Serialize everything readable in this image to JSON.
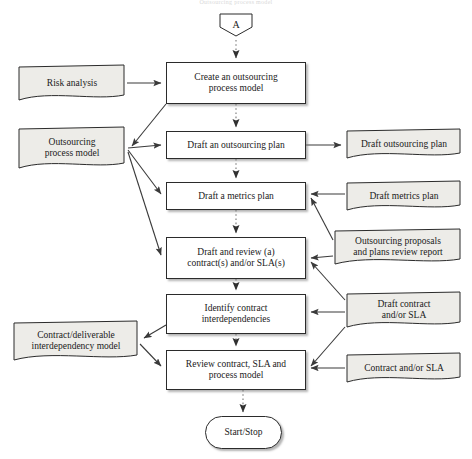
{
  "diagram": {
    "title_strip": "Outsourcing process model",
    "colors": {
      "document_fill": "#edece8",
      "process_fill": "#ffffff",
      "stroke": "#2b2b2b",
      "arrow_solid": "#3a3a3a",
      "arrow_dotted": "#8c8c8c",
      "shadow": "#9a9a9a"
    },
    "nodes": [
      {
        "id": "connector-a",
        "shape": "connector",
        "label": "A",
        "x": 218,
        "y": 12,
        "w": 36,
        "h": 26,
        "font": 10
      },
      {
        "id": "risk-analysis",
        "shape": "document",
        "label": "Risk analysis",
        "x": 17,
        "y": 64,
        "w": 110,
        "h": 38,
        "font": 9.5
      },
      {
        "id": "create-process-model",
        "shape": "process",
        "label": "Create an outsourcing\nprocess model",
        "x": 166,
        "y": 62,
        "w": 140,
        "h": 42,
        "font": 9.5
      },
      {
        "id": "outsourcing-process-model",
        "shape": "document",
        "label": "Outsourcing\nprocess model",
        "x": 17,
        "y": 126,
        "w": 110,
        "h": 44,
        "font": 9.5
      },
      {
        "id": "draft-outsourcing-plan-task",
        "shape": "process",
        "label": "Draft an outsourcing plan",
        "x": 166,
        "y": 131,
        "w": 140,
        "h": 28,
        "font": 9.5
      },
      {
        "id": "draft-outsourcing-plan-doc",
        "shape": "document",
        "label": "Draft outsourcing plan",
        "x": 345,
        "y": 128,
        "w": 118,
        "h": 32,
        "font": 9.5
      },
      {
        "id": "draft-metrics-plan-task",
        "shape": "process",
        "label": "Draft a metrics plan",
        "x": 166,
        "y": 182,
        "w": 140,
        "h": 28,
        "font": 9.5
      },
      {
        "id": "draft-metrics-plan-doc",
        "shape": "document",
        "label": "Draft metrics plan",
        "x": 345,
        "y": 180,
        "w": 118,
        "h": 32,
        "font": 9.5
      },
      {
        "id": "draft-review-contract-task",
        "shape": "process",
        "label": "Draft and review (a)\ncontract(s) and/or SLA(s)",
        "x": 166,
        "y": 237,
        "w": 140,
        "h": 42,
        "font": 9.5
      },
      {
        "id": "review-report-doc",
        "shape": "document",
        "label": "Outsourcing proposals\nand plans review report",
        "x": 333,
        "y": 228,
        "w": 130,
        "h": 38,
        "font": 9.5
      },
      {
        "id": "identify-interdependencies-task",
        "shape": "process",
        "label": "Identify contract\ninterdependencies",
        "x": 166,
        "y": 294,
        "w": 140,
        "h": 40,
        "font": 9.5
      },
      {
        "id": "draft-contract-sla-doc",
        "shape": "document",
        "label": "Draft contract\nand/or SLA",
        "x": 345,
        "y": 291,
        "w": 118,
        "h": 38,
        "font": 9.5
      },
      {
        "id": "interdependency-model-doc",
        "shape": "document",
        "label": "Contract/deliverable\ninterdependency model",
        "x": 12,
        "y": 320,
        "w": 128,
        "h": 42,
        "font": 9.5
      },
      {
        "id": "review-contract-task",
        "shape": "process",
        "label": "Review contract, SLA and\nprocess model",
        "x": 166,
        "y": 350,
        "w": 140,
        "h": 40,
        "font": 9.5
      },
      {
        "id": "contract-sla-doc",
        "shape": "document",
        "label": "Contract and/or SLA",
        "x": 345,
        "y": 352,
        "w": 118,
        "h": 32,
        "font": 9.5
      },
      {
        "id": "start-stop",
        "shape": "terminal",
        "label": "Start/Stop",
        "x": 205,
        "y": 416,
        "w": 77,
        "h": 33,
        "font": 9.5
      }
    ],
    "edges": [
      {
        "from": "connector-a",
        "to": "create-process-model",
        "style": "dotted",
        "path": "M236,40 L236,58"
      },
      {
        "from": "risk-analysis",
        "to": "create-process-model",
        "style": "solid",
        "path": "M127,83 L161,83"
      },
      {
        "from": "create-process-model",
        "to": "outsourcing-process-model",
        "style": "solid",
        "path": "M166,104 L132,146"
      },
      {
        "from": "create-process-model",
        "to": "draft-outsourcing-plan-task",
        "style": "dotted",
        "path": "M236,104 L236,127"
      },
      {
        "from": "outsourcing-process-model",
        "to": "draft-outsourcing-plan-task",
        "style": "solid",
        "path": "M128,148 L161,145"
      },
      {
        "from": "outsourcing-process-model",
        "to": "draft-metrics-plan-task",
        "style": "solid",
        "path": "M128,150 L161,194"
      },
      {
        "from": "outsourcing-process-model",
        "to": "draft-review-contract-task",
        "style": "solid",
        "path": "M128,152 L161,255"
      },
      {
        "from": "draft-outsourcing-plan-task",
        "to": "draft-outsourcing-plan-doc",
        "style": "solid",
        "path": "M306,145 L341,145"
      },
      {
        "from": "draft-outsourcing-plan-task",
        "to": "draft-metrics-plan-task",
        "style": "dotted",
        "path": "M236,159 L236,178"
      },
      {
        "from": "draft-metrics-plan-task",
        "to": "draft-review-contract-task",
        "style": "dotted",
        "path": "M236,210 L236,233"
      },
      {
        "from": "draft-metrics-plan-doc",
        "to": "draft-metrics-plan-task",
        "style": "solid",
        "path": "M345,194 L311,194"
      },
      {
        "from": "review-report-doc",
        "to": "draft-metrics-plan-task",
        "style": "solid",
        "path": "M333,240 L311,198"
      },
      {
        "from": "review-report-doc",
        "to": "draft-review-contract-task",
        "style": "solid",
        "path": "M333,256 L311,258"
      },
      {
        "from": "draft-review-contract-task",
        "to": "identify-interdependencies-task",
        "style": "dotted",
        "path": "M236,279 L236,290"
      },
      {
        "from": "draft-contract-sla-doc",
        "to": "draft-review-contract-task",
        "style": "solid",
        "path": "M345,300 L311,262"
      },
      {
        "from": "draft-contract-sla-doc",
        "to": "identify-interdependencies-task",
        "style": "solid",
        "path": "M345,312 L311,312"
      },
      {
        "from": "identify-interdependencies-task",
        "to": "interdependency-model-doc",
        "style": "solid",
        "path": "M166,325 L144,338"
      },
      {
        "from": "identify-interdependencies-task",
        "to": "review-contract-task",
        "style": "dotted",
        "path": "M236,334 L236,346"
      },
      {
        "from": "interdependency-model-doc",
        "to": "review-contract-task",
        "style": "solid",
        "path": "M140,344 L161,366"
      },
      {
        "from": "draft-contract-sla-doc",
        "to": "review-contract-task",
        "style": "solid",
        "path": "M345,327 L311,366"
      },
      {
        "from": "contract-sla-doc",
        "to": "review-contract-task",
        "style": "solid",
        "path": "M345,368 L311,368"
      },
      {
        "from": "review-contract-task",
        "to": "start-stop",
        "style": "dotted",
        "path": "M243,390 L243,412"
      }
    ]
  }
}
